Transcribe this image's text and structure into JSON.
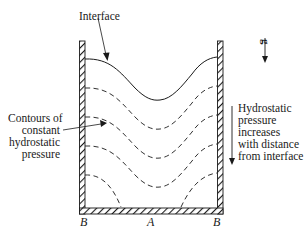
{
  "labels": {
    "interface": "Interface",
    "gravity": "g",
    "contours": [
      "Contours of",
      "constant",
      "hydrostatic",
      "pressure"
    ],
    "pressure_note": [
      "Hydrostatic",
      "pressure",
      "increases",
      "with distance",
      "from interface"
    ],
    "point_b_left": "B",
    "point_a": "A",
    "point_b_right": "B"
  },
  "colors": {
    "line": "#1a1a1a",
    "background": "#ffffff"
  }
}
